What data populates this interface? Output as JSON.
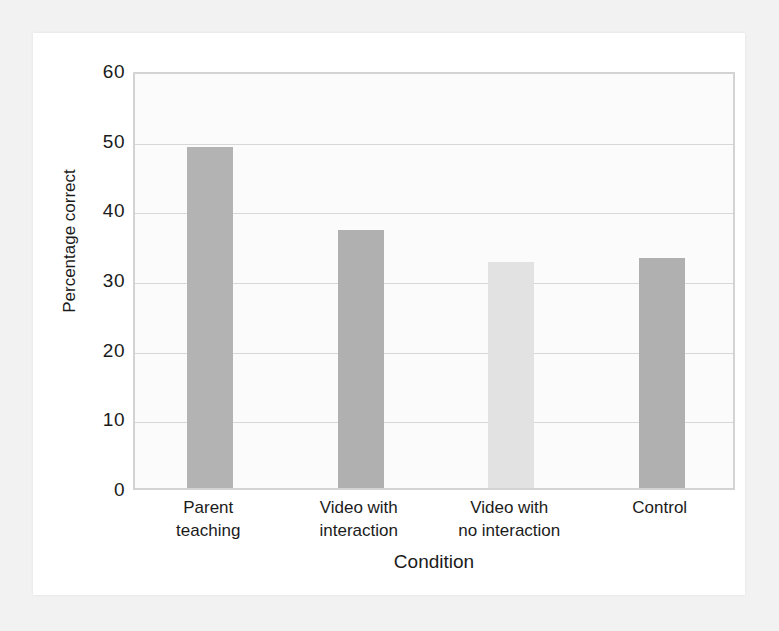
{
  "chart_data": {
    "type": "bar",
    "title": "",
    "xlabel": "Condition",
    "ylabel": "Percentage correct",
    "categories": [
      "Parent teaching",
      "Video with interaction",
      "Video with no interaction",
      "Control"
    ],
    "category_lines": [
      [
        "Parent",
        "teaching"
      ],
      [
        "Video with",
        "interaction"
      ],
      [
        "Video with",
        "no interaction"
      ],
      [
        "Control",
        ""
      ]
    ],
    "values": [
      49,
      37,
      32.5,
      33
    ],
    "bar_colors": [
      "#b3b3b3",
      "#b0b0b0",
      "#e2e2e2",
      "#b0b0b0"
    ],
    "ylim": [
      0,
      60
    ],
    "yticks": [
      0,
      10,
      20,
      30,
      40,
      50,
      60
    ],
    "ytick_labels": [
      "0",
      "10",
      "20",
      "30",
      "40",
      "50",
      "60"
    ],
    "grid": true,
    "grid_axis": "y",
    "legend": "none",
    "xlim_categories": 4
  },
  "colors": {
    "page_background": "#f2f2f2",
    "card_background": "#ffffff",
    "plot_background": "#fbfbfb",
    "frame": "#d3d3d3",
    "gridline": "#d7d7d7",
    "text": "#1b1b1b",
    "bar_dark": "#b0b0b0",
    "bar_light": "#e2e2e2"
  }
}
